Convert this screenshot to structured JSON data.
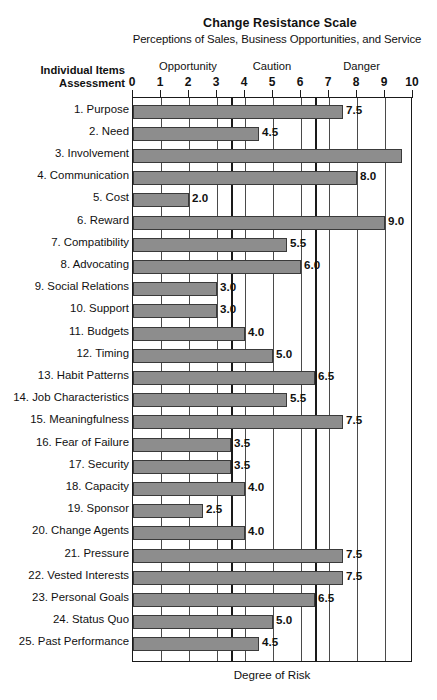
{
  "header": {
    "title": "Change Resistance Scale",
    "subtitle": "Perceptions of Sales, Business Opportunities, and Service",
    "axis_caption_line1": "Individual Items",
    "axis_caption_line2": "Assessment"
  },
  "chart_data": {
    "type": "bar",
    "orientation": "horizontal",
    "title": "Change Resistance Scale",
    "subtitle": "Perceptions of Sales, Business Opportunities, and Service",
    "xlabel": "Degree of Risk",
    "ylabel": "Individual Items Assessment",
    "xlim": [
      0,
      10
    ],
    "xticks": [
      0,
      1,
      2,
      3,
      4,
      5,
      6,
      7,
      8,
      9,
      10
    ],
    "xtick_labels": [
      "0",
      "1",
      "2",
      "3",
      "4",
      "5",
      "6",
      "7",
      "8",
      "9",
      "10"
    ],
    "grid": true,
    "legend": "none",
    "bar_color": "#8d8d8d",
    "bar_edge_color": "#3a3a3a",
    "zones": [
      {
        "name": "Opportunity",
        "start": 0,
        "end": 3.5,
        "label_at": 2.0
      },
      {
        "name": "Caution",
        "start": 3.5,
        "end": 6.5,
        "label_at": 5.0
      },
      {
        "name": "Danger",
        "start": 6.5,
        "end": 10,
        "label_at": 8.2
      }
    ],
    "zone_dividers": [
      3.5,
      6.5
    ],
    "categories": [
      "1. Purpose",
      "2. Need",
      "3. Involvement",
      "4. Communication",
      "5. Cost",
      "6. Reward",
      "7. Compatibility",
      "8. Advocating",
      "9. Social Relations",
      "10. Support",
      "11. Budgets",
      "12. Timing",
      "13. Habit Patterns",
      "14. Job Characteristics",
      "15. Meaningfulness",
      "16. Fear of Failure",
      "17. Security",
      "18. Capacity",
      "19. Sponsor",
      "20. Change Agents",
      "21. Pressure",
      "22. Vested Interests",
      "23. Personal Goals",
      "24. Status Quo",
      "25. Past Performance"
    ],
    "values": [
      7.5,
      4.5,
      9.6,
      8.0,
      2.0,
      9.0,
      5.5,
      6.0,
      3.0,
      3.0,
      4.0,
      5.0,
      6.5,
      5.5,
      7.5,
      3.5,
      3.5,
      4.0,
      2.5,
      4.0,
      7.5,
      7.5,
      6.5,
      5.0,
      4.5
    ],
    "value_labels": [
      "7.5",
      "4.5",
      "",
      "8.0",
      "2.0",
      "9.0",
      "5.5",
      "6.0",
      "3.0",
      "3.0",
      "4.0",
      "5.0",
      "6.5",
      "5.5",
      "7.5",
      "3.5",
      "3.5",
      "4.0",
      "2.5",
      "4.0",
      "7.5",
      "7.5",
      "6.5",
      "5.0",
      "4.5"
    ]
  }
}
